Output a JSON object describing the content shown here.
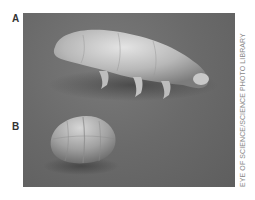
{
  "figure": {
    "panel_labels": [
      "A",
      "B"
    ],
    "credit": "EYE OF SCIENCE/SCIENCE PHOTO LIBRARY",
    "subjects": [
      {
        "label": "A",
        "description": "tardigrade (active, hydrated form)"
      },
      {
        "label": "B",
        "description": "tardigrade (tun, desiccated form)"
      }
    ],
    "colors": {
      "background": "#ffffff",
      "photo_bg": "#6a6a6a",
      "subject_light": "#d8d8d8",
      "label_text": "#333333",
      "credit_text": "#888888"
    }
  }
}
